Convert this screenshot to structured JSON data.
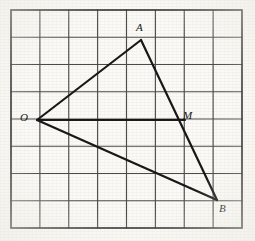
{
  "figure": {
    "kind": "geometry-grid-figure",
    "background_color": "#fbfaf6",
    "grid": {
      "columns": 8,
      "rows": 8,
      "left": 11,
      "top": 10,
      "right": 242,
      "bottom": 228,
      "cell_width": 28.875,
      "cell_height": 27.25,
      "line_color": "#4a4a4a",
      "border_color": "#2e2e2e"
    },
    "shape": {
      "name": "triangle",
      "stroke_color": "#161616",
      "vertices": [
        {
          "label": "O",
          "x": 37,
          "y": 120,
          "grid_x": 0.9,
          "grid_y": 4.04
        },
        {
          "label": "A",
          "x": 141,
          "y": 40,
          "grid_x": 4.5,
          "grid_y": 1.1
        },
        {
          "label": "B",
          "x": 217,
          "y": 200,
          "grid_x": 7.13,
          "grid_y": 6.97
        }
      ],
      "sides": [
        {
          "from": "O",
          "to": "A"
        },
        {
          "from": "A",
          "to": "B"
        },
        {
          "from": "O",
          "to": "B"
        }
      ]
    },
    "points": [
      {
        "label": "M",
        "x": 185,
        "y": 120,
        "grid_x": 6.02,
        "grid_y": 4.04,
        "on_segment": "AB"
      }
    ],
    "segments": [
      {
        "from": "O",
        "to": "M",
        "note": "horizontal segment from O to M"
      }
    ],
    "labels": [
      {
        "name": "label-A",
        "text": "A",
        "left": 136,
        "top": 22
      },
      {
        "name": "label-O",
        "text": "O",
        "left": 20,
        "top": 112
      },
      {
        "name": "label-M",
        "text": "M",
        "left": 183,
        "top": 110
      },
      {
        "name": "label-B",
        "text": "B",
        "left": 219,
        "top": 203
      }
    ]
  }
}
